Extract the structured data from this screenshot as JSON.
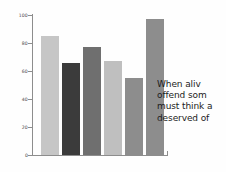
{
  "chart_data": {
    "type": "bar",
    "title": "",
    "xlabel": "",
    "ylabel": "",
    "ylim": [
      0,
      100
    ],
    "grid": false,
    "legend": "none",
    "categories": [
      "1",
      "2",
      "3",
      "4",
      "5",
      "6"
    ],
    "values": [
      85,
      66,
      77,
      67,
      55,
      97
    ],
    "bar_colors": [
      "#c6c6c6",
      "#3b3b3b",
      "#6f6f6f",
      "#bfbfbf",
      "#8d8d8d",
      "#8d8d8d"
    ],
    "y_ticks": [
      0,
      20,
      40,
      60,
      80,
      100
    ],
    "y_tick_labels": [
      "0",
      "20",
      "40",
      "60",
      "80",
      "100"
    ],
    "axis_color": "#8d8d8d"
  },
  "annotation": {
    "lines": [
      "When  aliv",
      "offend som",
      "must think a",
      "deserved of"
    ]
  }
}
